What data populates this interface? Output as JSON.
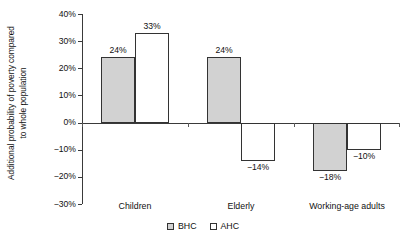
{
  "chart_data": {
    "type": "bar",
    "title": "",
    "subtitle": "",
    "xlabel": "",
    "ylabel": "Additional probability of poverty compared to whole population",
    "ylabel_line1": "Additional probability of poverty compared",
    "ylabel_line2": "to whole population",
    "categories": [
      "Children",
      "Elderly",
      "Working-age adults"
    ],
    "series": [
      {
        "name": "BHC",
        "color": "#d2d2d2",
        "values": [
          24,
          24,
          -18
        ],
        "labels": [
          "24%",
          "24%",
          "−18%"
        ]
      },
      {
        "name": "AHC",
        "color": "#ffffff",
        "values": [
          33,
          -14,
          -10
        ],
        "labels": [
          "33%",
          "−14%",
          "−10%"
        ]
      }
    ],
    "ylim": [
      -30,
      40
    ],
    "yticks": [
      40,
      30,
      20,
      10,
      0,
      -10,
      -20,
      -30
    ],
    "ytick_labels": [
      "40%",
      "30%",
      "20%",
      "10%",
      "0%",
      "−10%",
      "−20%",
      "−30%"
    ],
    "grid": false,
    "legend_position": "bottom"
  },
  "legend": {
    "items": [
      {
        "label": "BHC",
        "swatch": "bhc"
      },
      {
        "label": "AHC",
        "swatch": "ahc"
      }
    ]
  }
}
